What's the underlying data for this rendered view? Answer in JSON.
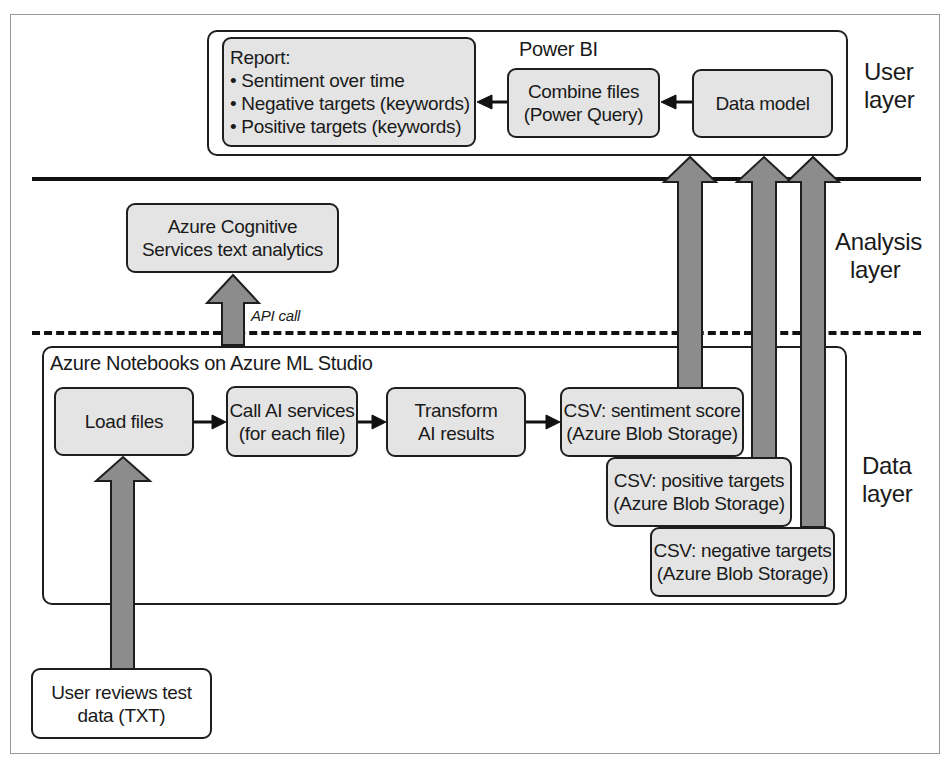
{
  "diagram": {
    "layers": {
      "user": [
        "User",
        "layer"
      ],
      "analysis": [
        "Analysis",
        "layer"
      ],
      "data": [
        "Data",
        "layer"
      ]
    },
    "power_bi": {
      "title": "Power BI",
      "report": {
        "heading": "Report:",
        "items": [
          "• Sentiment over time",
          "• Negative targets (keywords)",
          "• Positive targets (keywords)"
        ]
      },
      "combine_files": [
        "Combine files",
        "(Power Query)"
      ],
      "data_model": "Data model"
    },
    "cognitive_services": [
      "Azure Cognitive",
      "Services text analytics"
    ],
    "api_call_label": "API call",
    "notebooks": {
      "title": "Azure Notebooks on Azure ML Studio",
      "load_files": "Load files",
      "call_ai": [
        "Call AI services",
        "(for each file)"
      ],
      "transform": [
        "Transform",
        "AI results"
      ],
      "csv_sentiment": [
        "CSV: sentiment score",
        "(Azure Blob Storage)"
      ],
      "csv_positive": [
        "CSV: positive targets",
        "(Azure Blob Storage)"
      ],
      "csv_negative": [
        "CSV: negative targets",
        "(Azure Blob Storage)"
      ]
    },
    "source": [
      "User reviews test",
      "data (TXT)"
    ],
    "colors": {
      "box_fill": "#e4e4e4",
      "arrow_fill": "#8c8c8c",
      "stroke": "#1e1e1e"
    }
  }
}
